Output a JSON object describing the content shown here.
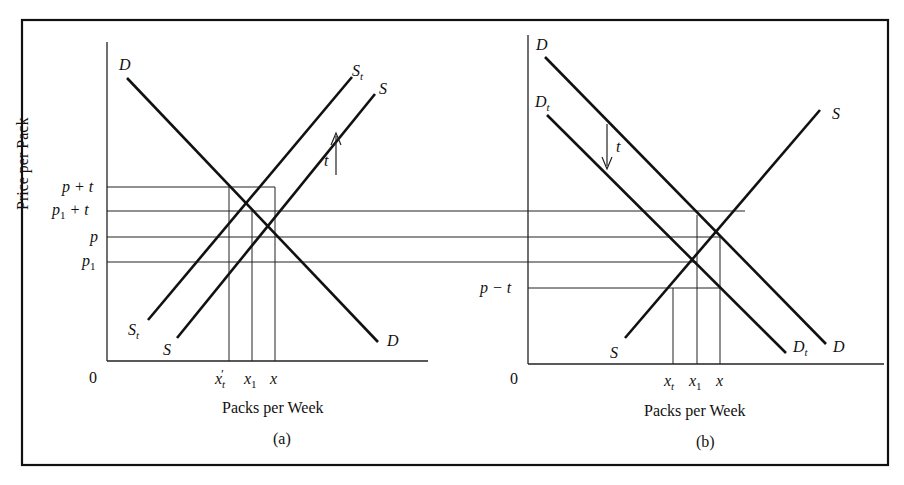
{
  "figure": {
    "title_partial": "Figure — The Incidence of an Excise Tax",
    "panels": [
      {
        "id": "a",
        "caption": "(a)",
        "xlabel": "Packs per Week",
        "ylabel": "Price per Pack",
        "origin": "0",
        "price_ticks": [
          {
            "label_base": "p",
            "label_sub": "",
            "label_suffix": " + t"
          },
          {
            "label_base": "p",
            "label_sub": "1",
            "label_suffix": " + t"
          },
          {
            "label_base": "p",
            "label_sub": "",
            "label_suffix": ""
          },
          {
            "label_base": "p",
            "label_sub": "1",
            "label_suffix": ""
          }
        ],
        "quantity_ticks": [
          {
            "base": "x",
            "sub": "t",
            "prime": "′"
          },
          {
            "base": "x",
            "sub": "1",
            "prime": ""
          },
          {
            "base": "x",
            "sub": "",
            "prime": ""
          }
        ],
        "curves": [
          {
            "name": "D",
            "label_top": "D",
            "label_bottom": "D"
          },
          {
            "name": "St",
            "label_top": "S",
            "label_top_sub": "t",
            "label_bottom": "S",
            "label_bottom_sub": "t"
          },
          {
            "name": "S",
            "label_top": "S",
            "label_bottom": "S"
          }
        ],
        "shift_label": "t",
        "shift_direction": "up"
      },
      {
        "id": "b",
        "caption": "(b)",
        "xlabel": "Packs per Week",
        "origin": "0",
        "price_ticks": [
          {
            "label_base": "p",
            "label_sub": "",
            "label_suffix": " − t"
          }
        ],
        "quantity_ticks": [
          {
            "base": "x",
            "sub": "t",
            "prime": ""
          },
          {
            "base": "x",
            "sub": "1",
            "prime": ""
          },
          {
            "base": "x",
            "sub": "",
            "prime": ""
          }
        ],
        "curves": [
          {
            "name": "D",
            "label_top": "D",
            "label_bottom": "D"
          },
          {
            "name": "Dt",
            "label_top": "D",
            "label_top_sub": "t",
            "label_bottom": "D",
            "label_bottom_sub": "t"
          },
          {
            "name": "S",
            "label_top": "S",
            "label_bottom": "S"
          }
        ],
        "shift_label": "t",
        "shift_direction": "down"
      }
    ]
  }
}
